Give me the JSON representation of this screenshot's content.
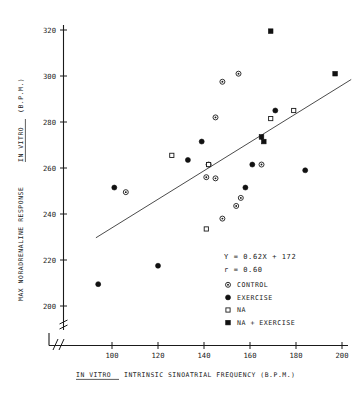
{
  "chart_data": {
    "type": "scatter",
    "title": "",
    "xlabel": "IN VITRO INTRINSIC SINOATRIAL FREQUENCY (B.P.M.)",
    "ylabel": "MAX NORADRENALINE RESPONSE IN VITRO (B.P.M.)",
    "xlabel_parts": {
      "italic_prefix": "IN VITRO",
      "rest": "INTRINSIC SINOATRIAL FREQUENCY (B.P.M.)"
    },
    "ylabel_parts": {
      "prefix": "MAX NORADRENALINE RESPONSE",
      "italic": "IN VITRO",
      "suffix": "(B.P.M.)"
    },
    "xlim": [
      88,
      207
    ],
    "ylim": [
      193,
      326
    ],
    "xticks": [
      100,
      120,
      140,
      160,
      180,
      200
    ],
    "yticks": [
      200,
      220,
      240,
      260,
      280,
      300,
      320
    ],
    "grid": false,
    "axis_break_x": true,
    "axis_break_y": true,
    "legend_position": "inside-lower-right",
    "annotations": [
      {
        "name": "regression-equation",
        "text": "Y = 0.62X + 172"
      },
      {
        "name": "correlation-coefficient",
        "text": "r = 0.60"
      }
    ],
    "fit_line": {
      "slope": 0.62,
      "intercept": 172,
      "x_start": 93,
      "x_end": 204
    },
    "series": [
      {
        "name": "CONTROL",
        "marker": "circle-dot",
        "filled": false,
        "points": [
          [
            106,
            249.5
          ],
          [
            141,
            256.0
          ],
          [
            145,
            255.5
          ],
          [
            148,
            297.5
          ],
          [
            148,
            238.0
          ],
          [
            155,
            301.0
          ],
          [
            145,
            282.0
          ],
          [
            156,
            247.0
          ],
          [
            154,
            243.5
          ],
          [
            165,
            261.5
          ],
          [
            142,
            261.5
          ]
        ]
      },
      {
        "name": "EXERCISE",
        "marker": "circle",
        "filled": true,
        "points": [
          [
            94,
            209.5
          ],
          [
            101,
            251.5
          ],
          [
            120,
            217.5
          ],
          [
            133,
            263.5
          ],
          [
            139,
            271.5
          ],
          [
            158,
            251.5
          ],
          [
            161,
            261.5
          ],
          [
            171,
            285.0
          ],
          [
            184,
            259.0
          ]
        ]
      },
      {
        "name": "NA",
        "marker": "square",
        "filled": false,
        "points": [
          [
            126,
            265.5
          ],
          [
            141,
            233.5
          ],
          [
            142,
            261.5
          ],
          [
            169,
            281.5
          ],
          [
            179,
            285.0
          ]
        ]
      },
      {
        "name": "NA + EXERCISE",
        "marker": "square",
        "filled": true,
        "points": [
          [
            169,
            319.5
          ],
          [
            165,
            273.5
          ],
          [
            166,
            271.5
          ],
          [
            197,
            301.0
          ]
        ]
      }
    ]
  },
  "legend": {
    "items": [
      {
        "label": "CONTROL",
        "marker": "circle-dot"
      },
      {
        "label": "EXERCISE",
        "marker": "circle-filled"
      },
      {
        "label": "NA",
        "marker": "square-open"
      },
      {
        "label": "NA + EXERCISE",
        "marker": "square-filled"
      }
    ]
  },
  "colors": {
    "ink": "#1a1a1a",
    "line": "#2b2b2b",
    "background": "#ffffff"
  }
}
